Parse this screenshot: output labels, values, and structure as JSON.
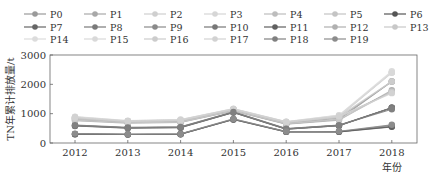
{
  "chart_data": {
    "type": "line",
    "title": "",
    "xlabel": "年份",
    "ylabel": "TN年累计排放量/t",
    "x": [
      "2012",
      "2013",
      "2014",
      "2015",
      "2016",
      "2017",
      "2018"
    ],
    "ylim": [
      0,
      3000
    ],
    "yticks": [
      0,
      1000,
      2000,
      3000
    ],
    "grid": false,
    "legend_position": "top",
    "series": [
      {
        "name": "P0",
        "color": "#9a9a9a",
        "values": [
          800,
          700,
          720,
          1100,
          650,
          800,
          2100
        ]
      },
      {
        "name": "P1",
        "color": "#a8a8a8",
        "values": [
          850,
          720,
          750,
          1120,
          680,
          850,
          2100
        ]
      },
      {
        "name": "P2",
        "color": "#cfcfcf",
        "values": [
          870,
          740,
          780,
          1150,
          700,
          900,
          2400
        ]
      },
      {
        "name": "P3",
        "color": "#d6d6d6",
        "values": [
          880,
          750,
          790,
          1160,
          720,
          920,
          2400
        ]
      },
      {
        "name": "P4",
        "color": "#bdbdbd",
        "values": [
          820,
          710,
          740,
          1130,
          690,
          870,
          1750
        ]
      },
      {
        "name": "P5",
        "color": "#c4c4c4",
        "values": [
          840,
          720,
          760,
          1140,
          700,
          880,
          1750
        ]
      },
      {
        "name": "P6",
        "color": "#555555",
        "values": [
          600,
          520,
          540,
          1050,
          480,
          600,
          1200
        ]
      },
      {
        "name": "P7",
        "color": "#666666",
        "values": [
          580,
          510,
          520,
          1040,
          470,
          590,
          1200
        ]
      },
      {
        "name": "P8",
        "color": "#7a7a7a",
        "values": [
          590,
          515,
          530,
          1045,
          475,
          595,
          1200
        ]
      },
      {
        "name": "P9",
        "color": "#8a8a8a",
        "values": [
          300,
          290,
          300,
          800,
          380,
          380,
          600
        ]
      },
      {
        "name": "P10",
        "color": "#777777",
        "values": [
          310,
          295,
          305,
          810,
          385,
          390,
          560
        ]
      },
      {
        "name": "P11",
        "color": "#606060",
        "values": [
          300,
          290,
          300,
          800,
          380,
          380,
          550
        ]
      },
      {
        "name": "P12",
        "color": "#b0b0b0",
        "values": [
          760,
          680,
          700,
          1090,
          640,
          780,
          1800
        ]
      },
      {
        "name": "P13",
        "color": "#c8c8c8",
        "values": [
          780,
          690,
          710,
          1100,
          660,
          800,
          1750
        ]
      },
      {
        "name": "P14",
        "color": "#dcdcdc",
        "values": [
          900,
          760,
          800,
          1170,
          730,
          950,
          2450
        ]
      },
      {
        "name": "P15",
        "color": "#d9d9d9",
        "values": [
          890,
          755,
          795,
          1165,
          725,
          940,
          2400
        ]
      },
      {
        "name": "P16",
        "color": "#cccccc",
        "values": [
          860,
          740,
          770,
          1150,
          710,
          900,
          2100
        ]
      },
      {
        "name": "P17",
        "color": "#d2d2d2",
        "values": [
          870,
          745,
          780,
          1155,
          715,
          910,
          1700
        ]
      },
      {
        "name": "P18",
        "color": "#808080",
        "values": [
          610,
          530,
          550,
          1060,
          490,
          610,
          1150
        ]
      },
      {
        "name": "P19",
        "color": "#8c8c8c",
        "values": [
          320,
          300,
          310,
          820,
          390,
          400,
          620
        ]
      }
    ]
  },
  "axes": {
    "ylabel": "TN年累计排放量/t",
    "xlabel": "年份"
  }
}
